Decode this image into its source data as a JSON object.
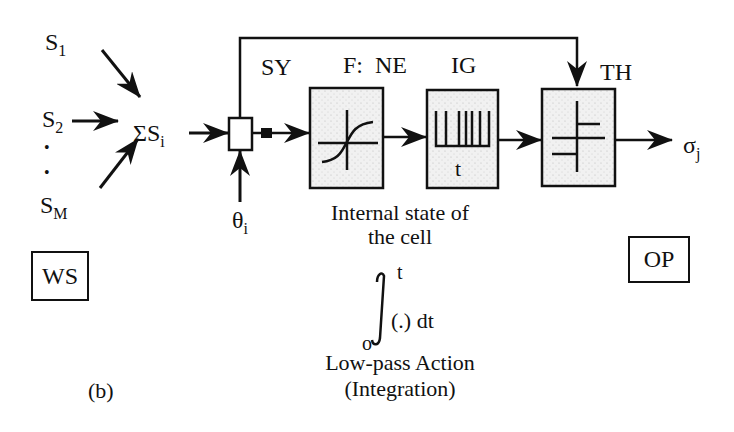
{
  "inputs": {
    "s1": {
      "base": "S",
      "sub": "1"
    },
    "s2": {
      "base": "S",
      "sub": "2"
    },
    "sm": {
      "base": "S",
      "sub": "M"
    },
    "ellipsis": "•"
  },
  "summation": {
    "symbol": "ΣS",
    "sub": "i"
  },
  "threshold_input": {
    "base": "θ",
    "sub": "i"
  },
  "blocks": {
    "sy": "SY",
    "ne": "F:  NE",
    "ig": "IG",
    "ig_axis": "t",
    "th": "TH"
  },
  "output": {
    "base": "σ",
    "sub": "j"
  },
  "internal_state": [
    "Internal state of",
    "the cell"
  ],
  "integral": {
    "upper": "t",
    "lower": "o",
    "body": "(.) dt"
  },
  "low_pass": [
    "Low-pass Action",
    "(Integration)"
  ],
  "ws_label": "WS",
  "op_label": "OP",
  "figure_label": "(b)",
  "colors": {
    "ink": "#111111",
    "block_fill": "#efefef",
    "background": "#ffffff"
  }
}
